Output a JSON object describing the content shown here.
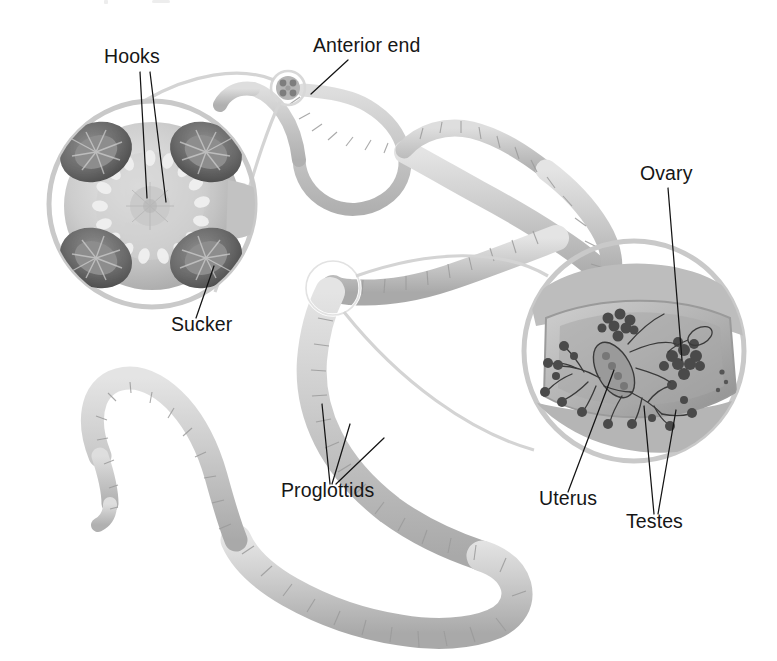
{
  "figure": {
    "organism": "tapeworm",
    "background_color": "#ffffff",
    "text_color": "#161616",
    "body_color": "#c9c9c9",
    "accent_color": "#6f6f6f",
    "width": 777,
    "height": 661
  },
  "labels": [
    {
      "id": "hooks",
      "text": "Hooks",
      "x": 104,
      "y": 63,
      "anchor": "start",
      "leader_count": 2,
      "points_to": "rostellar hook ring on scolex"
    },
    {
      "id": "anterior-end",
      "text": "Anterior end",
      "x": 313,
      "y": 52,
      "anchor": "start",
      "leader_count": 1,
      "points_to": "neck region behind scolex"
    },
    {
      "id": "sucker",
      "text": "Sucker",
      "x": 171,
      "y": 331,
      "anchor": "start",
      "leader_count": 1,
      "points_to": "lower-right sucker on scolex"
    },
    {
      "id": "proglottids",
      "text": "Proglottids",
      "x": 281,
      "y": 497,
      "anchor": "start",
      "leader_count": 3,
      "points_to": "body segments of strobila"
    },
    {
      "id": "ovary",
      "text": "Ovary",
      "x": 640,
      "y": 180,
      "anchor": "start",
      "leader_count": 1,
      "points_to": "ovary cluster inside mature proglottid"
    },
    {
      "id": "uterus",
      "text": "Uterus",
      "x": 539,
      "y": 505,
      "anchor": "start",
      "leader_count": 1,
      "points_to": "central uterus inside mature proglottid"
    },
    {
      "id": "testes",
      "text": "Testes",
      "x": 626,
      "y": 528,
      "anchor": "start",
      "leader_count": 2,
      "points_to": "branching testes inside mature proglottid"
    }
  ],
  "detail_views": [
    {
      "id": "scolex-detail",
      "name": "scolex-magnified-view",
      "center_x": 152,
      "center_y": 204,
      "radius": 105,
      "contents": [
        "rostellum",
        "hook-ring",
        "four-suckers"
      ],
      "sucker_count": 4,
      "source_x": 288,
      "source_y": 88,
      "source_radius": 17
    },
    {
      "id": "proglottid-detail",
      "name": "proglottid-magnified-view",
      "center_x": 634,
      "center_y": 351,
      "radius": 112,
      "contents": [
        "ovary",
        "uterus",
        "testes",
        "vitelline-gland"
      ],
      "source_x": 333,
      "source_y": 288,
      "source_radius": 27
    }
  ],
  "structures": [
    {
      "id": "scolex",
      "name": "scolex",
      "description": "anterior attachment head bearing four suckers and a crown of hooks"
    },
    {
      "id": "neck",
      "name": "neck",
      "description": "narrow proliferative region behind the scolex"
    },
    {
      "id": "strobila",
      "name": "strobila",
      "description": "chain of repeating proglottid segments forming the body"
    }
  ]
}
